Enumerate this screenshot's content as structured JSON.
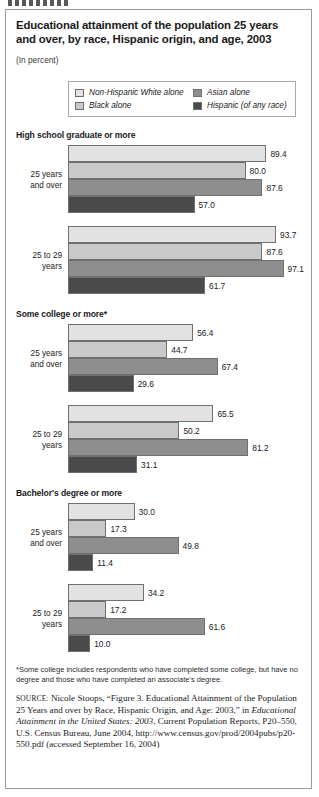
{
  "figure": {
    "title": "Educational attainment of the population 25 years and over, by race, Hispanic origin, and age, 2003",
    "subtitle": "(In percent)"
  },
  "legend": {
    "items": [
      {
        "label": "Non-Hispanic White alone",
        "color": "#e2e2e2"
      },
      {
        "label": "Asian alone",
        "color": "#8e8e8e"
      },
      {
        "label": "Black alone",
        "color": "#c9c9c9"
      },
      {
        "label": "Hispanic (of any race)",
        "color": "#4a4a4a"
      }
    ]
  },
  "footnote": "*Some college includes respondents who have completed some college, but have no degree and those who have completed an associate's degree.",
  "source": {
    "label": "SOURCE:",
    "part1": " Nicole Stoops, “Figure 3. Educational Attainment of the Population 25 Years and over by Race, Hispanic Origin, and Age: 2003,” in ",
    "italic": "Educational Attainment in the United States: 2003",
    "part2": ", Current Population Reports, P20–550, U.S. Census Bureau, June 2004, http://www.census.gov/prod/2004pubs/p20-550.pdf (accessed September 16, 2004)"
  },
  "chart_data": {
    "type": "bar",
    "orientation": "horizontal",
    "title": "Educational attainment of the population 25 years and over, by race, Hispanic origin, and age, 2003",
    "subtitle": "(In percent)",
    "xlabel": "",
    "ylabel": "",
    "units": "percent",
    "xlim": [
      0,
      100
    ],
    "grid": false,
    "legend_position": "top",
    "series_names": [
      "Non-Hispanic White alone",
      "Black alone",
      "Asian alone",
      "Hispanic (of any race)"
    ],
    "series_colors": [
      "#e2e2e2",
      "#c9c9c9",
      "#8e8e8e",
      "#4a4a4a"
    ],
    "panels": [
      {
        "title": "High school graduate or more",
        "groups": [
          {
            "label": "25 years and over",
            "label_lines": [
              "25 years",
              "and over"
            ],
            "values": [
              89.4,
              80.0,
              87.6,
              57.0
            ]
          },
          {
            "label": "25 to 29 years",
            "label_lines": [
              "25 to 29",
              "years"
            ],
            "values": [
              93.7,
              87.6,
              97.1,
              61.7
            ]
          }
        ]
      },
      {
        "title": "Some college or more*",
        "groups": [
          {
            "label": "25 years and over",
            "label_lines": [
              "25 years",
              "and over"
            ],
            "values": [
              56.4,
              44.7,
              67.4,
              29.6
            ]
          },
          {
            "label": "25 to 29 years",
            "label_lines": [
              "25 to 29",
              "years"
            ],
            "values": [
              65.5,
              50.2,
              81.2,
              31.1
            ]
          }
        ]
      },
      {
        "title": "Bachelor's degree or more",
        "groups": [
          {
            "label": "25 years and over",
            "label_lines": [
              "25 years",
              "and over"
            ],
            "values": [
              30.0,
              17.3,
              49.8,
              11.4
            ]
          },
          {
            "label": "25 to 29 years",
            "label_lines": [
              "25 to 29",
              "years"
            ],
            "values": [
              34.2,
              17.2,
              61.6,
              10.0
            ]
          }
        ]
      }
    ]
  }
}
